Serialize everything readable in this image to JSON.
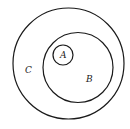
{
  "diagram": {
    "type": "euler-nested-sets",
    "stroke_color": "#1a1a1a",
    "background": "#ffffff",
    "sets": [
      {
        "name": "C",
        "label": "C",
        "cx": 68.5,
        "cy": 63.5,
        "r": 55.5,
        "label_x": 25,
        "label_y": 73
      },
      {
        "name": "B",
        "label": "B",
        "cx": 78,
        "cy": 67.5,
        "r": 35,
        "label_x": 86,
        "label_y": 82
      },
      {
        "name": "A",
        "label": "A",
        "cx": 63,
        "cy": 55,
        "r": 10,
        "label_x": 60,
        "label_y": 58
      }
    ],
    "relation": "A ⊂ B ⊂ C"
  }
}
